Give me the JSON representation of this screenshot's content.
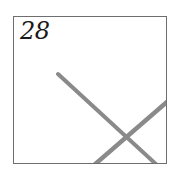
{
  "panel": {
    "number_label": "28",
    "frame_color": "#6e6e6e",
    "stroke_color": "#8a8a8a"
  },
  "drawing": {
    "strokes": [
      {
        "name": "stroke-1",
        "from": [
          58,
          74
        ],
        "to": [
          158,
          164
        ]
      },
      {
        "name": "stroke-2",
        "from": [
          94,
          164
        ],
        "to": [
          167,
          102
        ]
      }
    ]
  }
}
